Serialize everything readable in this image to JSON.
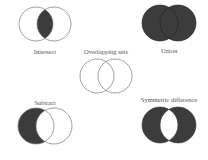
{
  "diagram": {
    "colors": {
      "fill": "#3c3c3c",
      "stroke": "#555555",
      "background": "#ffffff"
    },
    "panels": [
      {
        "id": "intersect",
        "label": "Intersect",
        "shaded": "A ∩ B"
      },
      {
        "id": "union",
        "label": "Union",
        "shaded": "A ∪ B"
      },
      {
        "id": "overlapping",
        "label": "Overlapping sets",
        "shaded": "none"
      },
      {
        "id": "subtract",
        "label": "Subtract",
        "shaded": "A − B"
      },
      {
        "id": "symmetric",
        "label": "Symmetric difference",
        "shaded": "A △ B"
      }
    ]
  }
}
